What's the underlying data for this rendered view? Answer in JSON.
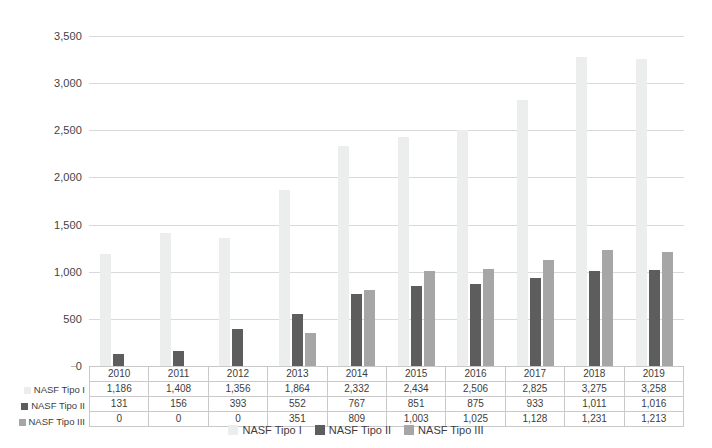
{
  "chart_data": {
    "type": "bar",
    "title": "",
    "xlabel": "",
    "ylabel": "",
    "categories": [
      "2010",
      "2011",
      "2012",
      "2013",
      "2014",
      "2015",
      "2016",
      "2017",
      "2018",
      "2019"
    ],
    "series": [
      {
        "name": "NASF Tipo I",
        "color": "#eceded",
        "values": [
          1186,
          1408,
          1356,
          1864,
          2332,
          2434,
          2506,
          2825,
          3275,
          3258
        ],
        "labels": [
          "1,186",
          "1,408",
          "1,356",
          "1,864",
          "2,332",
          "2,434",
          "2,506",
          "2,825",
          "3,275",
          "3,258"
        ]
      },
      {
        "name": "NASF Tipo II",
        "color": "#5d5d5d",
        "values": [
          131,
          156,
          393,
          552,
          767,
          851,
          875,
          933,
          1011,
          1016
        ],
        "labels": [
          "131",
          "156",
          "393",
          "552",
          "767",
          "851",
          "875",
          "933",
          "1,011",
          "1,016"
        ]
      },
      {
        "name": "NASF Tipo III",
        "color": "#a6a6a6",
        "values": [
          0,
          0,
          0,
          351,
          809,
          1003,
          1025,
          1128,
          1231,
          1213
        ],
        "labels": [
          "0",
          "0",
          "0",
          "351",
          "809",
          "1,003",
          "1,025",
          "1,128",
          "1,231",
          "1,213"
        ]
      }
    ],
    "ylim": [
      0,
      3500
    ],
    "ytick_values": [
      0,
      500,
      1000,
      1500,
      2000,
      2500,
      3000,
      3500
    ],
    "ytick_labels": [
      "0",
      "500",
      "1,000",
      "1,500",
      "2,000",
      "2,500",
      "3,000",
      "3,500"
    ],
    "grid": true,
    "legend_position": "bottom",
    "data_table_visible": true
  },
  "legend": {
    "items": [
      {
        "label": "NASF Tipo I",
        "swatch": "s0"
      },
      {
        "label": "NASF Tipo II",
        "swatch": "s1"
      },
      {
        "label": "NASF Tipo III",
        "swatch": "s2"
      }
    ]
  }
}
